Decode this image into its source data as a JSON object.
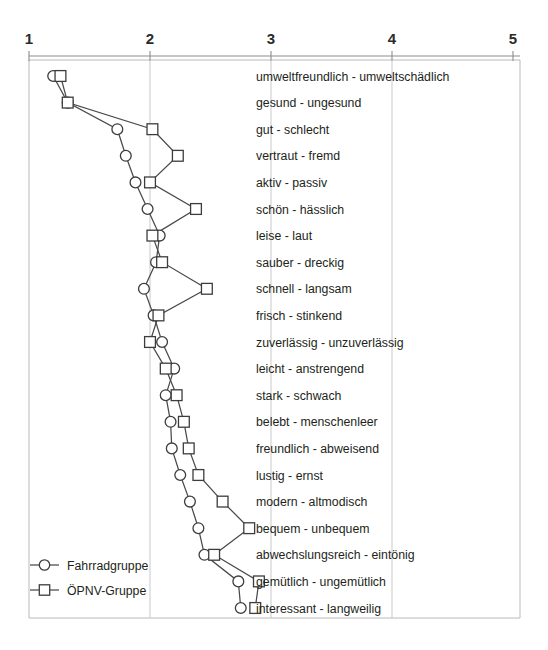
{
  "chart_data": {
    "type": "line",
    "title": "",
    "subtitle": "",
    "xlabel": "",
    "ylabel": "",
    "orientation": "horizontal",
    "xlim": [
      1,
      5
    ],
    "xticks": [
      "1",
      "2",
      "3",
      "4",
      "5"
    ],
    "grid": true,
    "grid_axis": "x",
    "legend_position": "bottom-left",
    "categories": [
      "umweltfreundlich - umweltschädlich",
      "gesund - ungesund",
      "gut - schlecht",
      "vertraut - fremd",
      "aktiv - passiv",
      "schön - hässlich",
      "leise - laut",
      "sauber - dreckig",
      "schnell - langsam",
      "frisch - stinkend",
      "zuverlässig - unzuverlässig",
      "leicht - anstrengend",
      "stark - schwach",
      "belebt - menschenleer",
      "freundlich - abweisend",
      "lustig - ernst",
      "modern - altmodisch",
      "bequem - unbequem",
      "abwechslungsreich - eintönig",
      "gemütlich - ungemütlich",
      "interessant - langweilig"
    ],
    "series": [
      {
        "name": "Fahrradgruppe",
        "marker": "circle",
        "values": [
          1.2,
          1.32,
          1.73,
          1.8,
          1.88,
          1.98,
          2.08,
          2.05,
          1.95,
          2.03,
          2.1,
          2.2,
          2.13,
          2.17,
          2.18,
          2.25,
          2.33,
          2.4,
          2.45,
          2.73,
          2.75
        ]
      },
      {
        "name": "ÖPNV-Gruppe",
        "marker": "square",
        "values": [
          1.26,
          1.32,
          2.02,
          2.23,
          2.0,
          2.38,
          2.02,
          2.1,
          2.47,
          2.07,
          2.0,
          2.13,
          2.22,
          2.28,
          2.32,
          2.4,
          2.6,
          2.82,
          2.53,
          2.9,
          2.87
        ]
      }
    ]
  },
  "legend": {
    "items": [
      {
        "label": "Fahrradgruppe",
        "marker": "circle"
      },
      {
        "label": "ÖPNV-Gruppe",
        "marker": "square"
      }
    ]
  }
}
